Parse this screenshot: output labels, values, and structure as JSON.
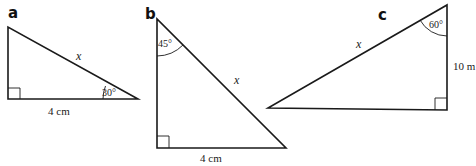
{
  "triangles": [
    {
      "id": "a",
      "label": "a",
      "hypotenuse_label": "x",
      "base_label": "4 cm",
      "angle_label": "30°",
      "right_angle": "bottom-left"
    },
    {
      "id": "b",
      "label": "b",
      "hypotenuse_label": "x",
      "base_label": "4 cm",
      "angle_label": "45°",
      "right_angle": "bottom-left"
    },
    {
      "id": "c",
      "label": "c",
      "hypotenuse_label": "x",
      "side_label": "10 m",
      "angle_label": "60°",
      "right_angle": "bottom-right"
    }
  ],
  "colors": {
    "stroke": "#1a1a1a",
    "background": "#ffffff"
  }
}
